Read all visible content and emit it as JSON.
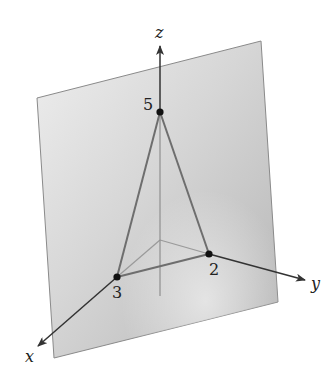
{
  "diagram": {
    "type": "3d-coordinate-plane",
    "axes": {
      "x": {
        "label": "x"
      },
      "y": {
        "label": "y"
      },
      "z": {
        "label": "z"
      }
    },
    "intercepts": [
      {
        "axis": "z",
        "value": "5"
      },
      {
        "axis": "x",
        "value": "3"
      },
      {
        "axis": "y",
        "value": "2"
      }
    ],
    "colors": {
      "plane_light": "#e6e6e6",
      "plane_dark": "#b8b8b8",
      "plane_edge": "#8a8a8a",
      "axis": "#333333",
      "hidden_line": "#9a9a9a",
      "triangle": "#6e6e6e",
      "point": "#111111"
    }
  }
}
